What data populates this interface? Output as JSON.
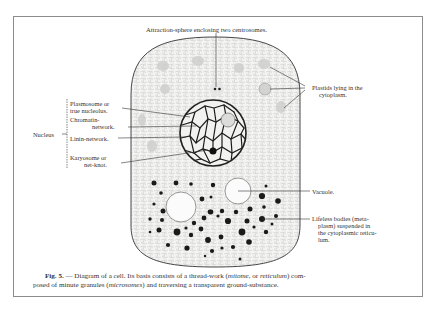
{
  "figure": {
    "labels": {
      "attraction_sphere": "Attraction-sphere enclosing two centrosomes.",
      "plastids_line1": "Plastids lying in the",
      "plastids_line2": "cytoplasm.",
      "plasmosome_line1": "Plasmosome or",
      "plasmosome_line2": "true nucleolus.",
      "chromatin_line1": "Chromatin-",
      "chromatin_line2": "network.",
      "linin": "Linin-network.",
      "karyosome_line1": "Karyosome or",
      "karyosome_line2": "net-knot.",
      "nucleus": "Nucleus",
      "vacuole": "Vacuole.",
      "lifeless_line1": "Lifeless bodies (meta-",
      "lifeless_line2": "plasm) suspended in",
      "lifeless_line3": "the cytoplasmic reticu-",
      "lifeless_line4": "lum."
    },
    "caption": {
      "fig_number": "Fig. 5.",
      "dash": " — ",
      "part1": "Diagram of a cell.  Its basis consists of a thread-work (",
      "term1": "mitome",
      "part2": ", or ",
      "term2": "reticulum",
      "part3": ") com-",
      "part4": "posed of minute granules (",
      "term3": "microsomes",
      "part5": ") and traversing a transparent ground-substance."
    },
    "colors": {
      "ink": "#1e1e1e",
      "stipple": "#b5b5b5",
      "frame": "#8c8c8c",
      "paper": "#ffffff"
    }
  }
}
